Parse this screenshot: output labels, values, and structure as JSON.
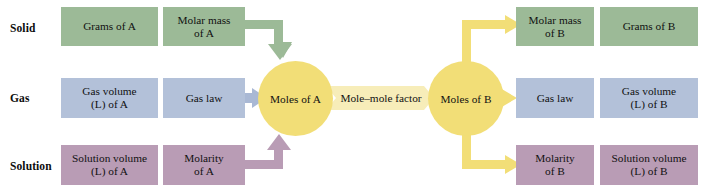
{
  "diagram": {
    "row_labels": [
      {
        "id": "solid",
        "label": "Solid"
      },
      {
        "id": "gas",
        "label": "Gas"
      },
      {
        "id": "solution",
        "label": "Solution"
      }
    ],
    "colors": {
      "solid": "#9cba97",
      "gas": "#b3c1d9",
      "solution": "#b99cb5",
      "moles": "#f2de77",
      "factor_band": "#f7edb9",
      "background": "#ffffff",
      "text": "#111111"
    },
    "left_side": {
      "solid": [
        {
          "id": "grams-of-a",
          "line1": "Grams of A",
          "line2": ""
        },
        {
          "id": "molar-mass-of-a",
          "line1": "Molar mass",
          "line2": "of A"
        }
      ],
      "gas": [
        {
          "id": "gas-volume-of-a",
          "line1": "Gas volume",
          "line2": "(L) of A"
        },
        {
          "id": "gas-law-a",
          "line1": "Gas law",
          "line2": ""
        }
      ],
      "solution": [
        {
          "id": "solution-volume-of-a",
          "line1": "Solution volume",
          "line2": "(L) of A"
        },
        {
          "id": "molarity-of-a",
          "line1": "Molarity",
          "line2": "of A"
        }
      ]
    },
    "center": {
      "moles_a": "Moles of A",
      "factor": "Mole–mole factor",
      "moles_b": "Moles of B"
    },
    "right_side": {
      "solid": [
        {
          "id": "molar-mass-of-b",
          "line1": "Molar mass",
          "line2": "of B"
        },
        {
          "id": "grams-of-b",
          "line1": "Grams of B",
          "line2": ""
        }
      ],
      "gas": [
        {
          "id": "gas-law-b",
          "line1": "Gas law",
          "line2": ""
        },
        {
          "id": "gas-volume-of-b",
          "line1": "Gas volume",
          "line2": "(L) of B"
        }
      ],
      "solution": [
        {
          "id": "molarity-of-b",
          "line1": "Molarity",
          "line2": "of B"
        },
        {
          "id": "solution-volume-of-b",
          "line1": "Solution volume",
          "line2": "(L) of B"
        }
      ]
    }
  }
}
